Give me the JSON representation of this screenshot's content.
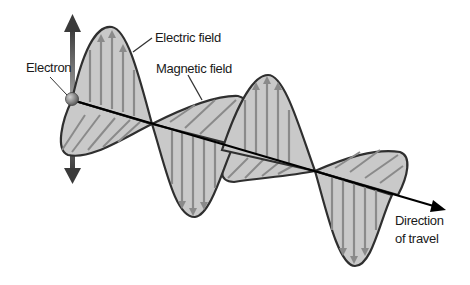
{
  "diagram": {
    "labels": {
      "electron": "Electron",
      "electric_field": "Electric field",
      "magnetic_field": "Magnetic field",
      "direction_line1": "Direction",
      "direction_line2": "of travel"
    },
    "colors": {
      "fill": "#c9c9c9",
      "outline": "#2f2f2f",
      "field_arrows": "#8a8a8a",
      "axis": "#000000",
      "background": "#ffffff"
    }
  }
}
